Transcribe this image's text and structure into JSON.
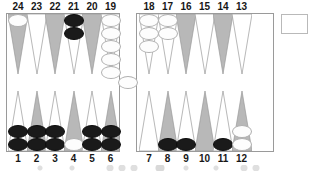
{
  "board": {
    "title": "backgammon-board-diagram",
    "colors": {
      "point_shaded": "#b8b8b8",
      "point_plain": "#ffffff",
      "point_outline": "#9a9a9a",
      "checker_white": "#fdfdfd",
      "checker_black": "#1a1a1a",
      "frame": "#9a9a9a",
      "label": "#171717"
    },
    "top_labels": [
      "24",
      "23",
      "22",
      "21",
      "20",
      "19",
      "18",
      "17",
      "16",
      "15",
      "14",
      "13"
    ],
    "bottom_labels": [
      "1",
      "2",
      "3",
      "4",
      "5",
      "6",
      "7",
      "8",
      "9",
      "10",
      "11",
      "12"
    ],
    "points": [
      {
        "num": "24",
        "row": "top",
        "quad": "left",
        "shade": "shaded",
        "checkers": 1,
        "color": "white"
      },
      {
        "num": "23",
        "row": "top",
        "quad": "left",
        "shade": "plain",
        "checkers": 0,
        "color": "none"
      },
      {
        "num": "22",
        "row": "top",
        "quad": "left",
        "shade": "shaded",
        "checkers": 0,
        "color": "none"
      },
      {
        "num": "21",
        "row": "top",
        "quad": "left",
        "shade": "plain",
        "checkers": 2,
        "color": "black"
      },
      {
        "num": "20",
        "row": "top",
        "quad": "left",
        "shade": "shaded",
        "checkers": 0,
        "color": "none"
      },
      {
        "num": "19",
        "row": "top",
        "quad": "left",
        "shade": "plain",
        "checkers": 5,
        "color": "white"
      },
      {
        "num": "18",
        "row": "top",
        "quad": "right",
        "shade": "plain",
        "checkers": 3,
        "color": "white"
      },
      {
        "num": "17",
        "row": "top",
        "quad": "right",
        "shade": "plain",
        "checkers": 2,
        "color": "white"
      },
      {
        "num": "16",
        "row": "top",
        "quad": "right",
        "shade": "shaded",
        "checkers": 0,
        "color": "none"
      },
      {
        "num": "15",
        "row": "top",
        "quad": "right",
        "shade": "plain",
        "checkers": 0,
        "color": "none"
      },
      {
        "num": "14",
        "row": "top",
        "quad": "right",
        "shade": "shaded",
        "checkers": 0,
        "color": "none"
      },
      {
        "num": "13",
        "row": "top",
        "quad": "right",
        "shade": "plain",
        "checkers": 0,
        "color": "none"
      },
      {
        "num": "1",
        "row": "bot",
        "quad": "left",
        "shade": "plain",
        "checkers": 2,
        "color": "black"
      },
      {
        "num": "2",
        "row": "bot",
        "quad": "left",
        "shade": "shaded",
        "checkers": 2,
        "color": "black"
      },
      {
        "num": "3",
        "row": "bot",
        "quad": "left",
        "shade": "plain",
        "checkers": 2,
        "color": "black"
      },
      {
        "num": "4",
        "row": "bot",
        "quad": "left",
        "shade": "shaded",
        "checkers": 1,
        "color": "white"
      },
      {
        "num": "5",
        "row": "bot",
        "quad": "left",
        "shade": "plain",
        "checkers": 2,
        "color": "black"
      },
      {
        "num": "6",
        "row": "bot",
        "quad": "left",
        "shade": "shaded",
        "checkers": 2,
        "color": "black"
      },
      {
        "num": "7",
        "row": "bot",
        "quad": "right",
        "shade": "plain",
        "checkers": 0,
        "color": "none"
      },
      {
        "num": "8",
        "row": "bot",
        "quad": "right",
        "shade": "shaded",
        "checkers": 1,
        "color": "black"
      },
      {
        "num": "9",
        "row": "bot",
        "quad": "right",
        "shade": "plain",
        "checkers": 1,
        "color": "black"
      },
      {
        "num": "10",
        "row": "bot",
        "quad": "right",
        "shade": "shaded",
        "checkers": 0,
        "color": "none"
      },
      {
        "num": "11",
        "row": "bot",
        "quad": "right",
        "shade": "plain",
        "checkers": 1,
        "color": "black"
      },
      {
        "num": "12",
        "row": "bot",
        "quad": "right",
        "shade": "shaded",
        "checkers": 2,
        "color": "white"
      }
    ],
    "bar": {
      "white_checkers": 1,
      "black_checkers": 0
    },
    "cube_box": {
      "value": ""
    }
  }
}
